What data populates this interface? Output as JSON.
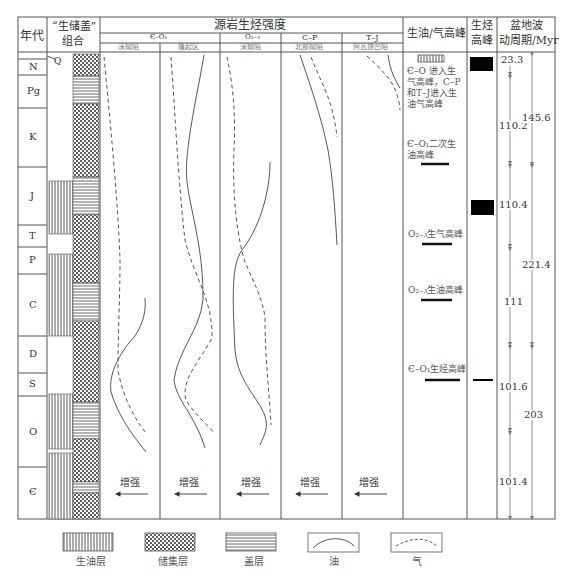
{
  "header": {
    "age": "年代",
    "assemblage_line1": "“生储盖”",
    "assemblage_line2": "组合",
    "source_title": "源岩生烃强度",
    "source_groups": [
      {
        "label": "Є–O₁",
        "subs": [
          "深拗陷",
          "隆起区"
        ]
      },
      {
        "label": "O₂₋₃",
        "subs": [
          "深拗陷"
        ]
      },
      {
        "label": "C–P",
        "subs": [
          "北部拗陷"
        ]
      },
      {
        "label": "T–J",
        "subs": [
          "阿瓦提凹陷"
        ]
      }
    ],
    "oil_gas_peak": "生油/气高峰",
    "hc_peak_line1": "生烃",
    "hc_peak_line2": "高峰",
    "basin_line1": "盆地波",
    "basin_line2": "动周期/Myr"
  },
  "ages": [
    {
      "label": "N",
      "top": 59,
      "bottom": 75
    },
    {
      "label": "Pg",
      "top": 75,
      "bottom": 108
    },
    {
      "label": "K",
      "top": 108,
      "bottom": 167
    },
    {
      "label": "J",
      "top": 167,
      "bottom": 225
    },
    {
      "label": "T",
      "top": 225,
      "bottom": 247
    },
    {
      "label": "P",
      "top": 247,
      "bottom": 274
    },
    {
      "label": "C",
      "top": 274,
      "bottom": 336
    },
    {
      "label": "D",
      "top": 336,
      "bottom": 373
    },
    {
      "label": "S",
      "top": 373,
      "bottom": 396
    },
    {
      "label": "O",
      "top": 396,
      "bottom": 467
    },
    {
      "label": "Є",
      "top": 467,
      "bottom": 519
    }
  ],
  "q_label": "Q",
  "enhance_label": "增强",
  "oil_gas_peaks": [
    {
      "text_lines": [
        "Є–O 进入生",
        "气高峰，C–P",
        "和T–J进入生",
        "油气高峰"
      ],
      "marker": "source-pattern"
    },
    {
      "text_lines": [
        "Є–O₁二次生",
        "油高峰"
      ],
      "marker": "bar"
    },
    {
      "text_lines": [
        "O₂₋₃生气高峰"
      ],
      "marker": "bar"
    },
    {
      "text_lines": [
        "O₂₋₃生油高峰"
      ],
      "marker": "bar"
    },
    {
      "text_lines": [
        "Є–O₁生烃高峰"
      ],
      "marker": "bar"
    }
  ],
  "basin_cycles": {
    "short": [
      "23.3",
      "110.2",
      "110.4",
      "111",
      "101.6",
      "101.4"
    ],
    "long": [
      "145.6",
      "221.4",
      "203"
    ]
  },
  "legend": [
    {
      "pattern": "source",
      "label": "生油层"
    },
    {
      "pattern": "reservoir",
      "label": "储集层"
    },
    {
      "pattern": "cap",
      "label": "盖层"
    },
    {
      "pattern": "oil",
      "label": "油"
    },
    {
      "pattern": "gas",
      "label": "气"
    }
  ]
}
